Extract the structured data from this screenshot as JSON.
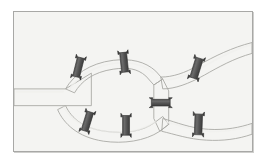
{
  "figure": {
    "width": 267,
    "height": 165,
    "background_color": "#ffffff"
  },
  "panel": {
    "background_color": "#f4f4f2",
    "border_color": "#a8a8a6",
    "shadow_color": "#cfcfcd",
    "x": 13,
    "y": 11,
    "width": 240,
    "height": 141
  },
  "colors": {
    "vessel_fill": "#d9d9d5",
    "vessel_fill_light": "#e6e6e2",
    "vessel_edge": "#a9a9a5",
    "vessel_highlight": "#f0f0ed",
    "clip_body": "#4a4a4a",
    "clip_body_light": "#6e6e6e",
    "clip_edge": "#2e2e2e"
  },
  "vessels": [
    {
      "id": "inlet-trunk",
      "label": "Main inlet trunk",
      "orientation": "horizontal",
      "from": "left-edge",
      "to": "bifurcation",
      "width_px": 13
    },
    {
      "id": "upper-arc",
      "label": "Upper arc branch",
      "orientation": "arc",
      "from": "bifurcation",
      "to": "central-junction",
      "width_px": 10
    },
    {
      "id": "lower-arc",
      "label": "Lower arc branch",
      "orientation": "arc",
      "from": "bifurcation",
      "to": "central-junction",
      "width_px": 10
    },
    {
      "id": "upper-right-branch",
      "label": "Upper right diagonal outlet",
      "orientation": "diagonal-up-right",
      "from": "central-junction",
      "to": "right-edge-upper",
      "width_px": 11
    },
    {
      "id": "lower-right-branch",
      "label": "Lower right horizontal outlet",
      "orientation": "horizontal",
      "from": "central-junction",
      "to": "right-edge-lower",
      "width_px": 11
    },
    {
      "id": "central-connector",
      "label": "Central vertical connector",
      "orientation": "vertical",
      "from": "upper-junction-node",
      "to": "lower-junction-node",
      "width_px": 9
    }
  ],
  "clips": [
    {
      "id": "clip-1",
      "label": "Clip on upper arc, proximal",
      "vessel": "upper-arc",
      "cx": 78,
      "cy": 67,
      "angle_deg": 14,
      "length": 19,
      "thickness": 5
    },
    {
      "id": "clip-2",
      "label": "Clip on upper arc, distal",
      "vessel": "upper-arc",
      "cx": 124,
      "cy": 62,
      "angle_deg": -6,
      "length": 19,
      "thickness": 5
    },
    {
      "id": "clip-3",
      "label": "Clip on lower arc, proximal",
      "vessel": "lower-arc",
      "cx": 87,
      "cy": 122,
      "angle_deg": 17,
      "length": 19,
      "thickness": 5
    },
    {
      "id": "clip-4",
      "label": "Clip on lower arc, distal",
      "vessel": "lower-arc",
      "cx": 126,
      "cy": 126,
      "angle_deg": 0,
      "length": 19,
      "thickness": 5
    },
    {
      "id": "clip-5",
      "label": "Clip on upper right diagonal outlet",
      "vessel": "upper-right-branch",
      "cx": 197,
      "cy": 68,
      "angle_deg": 17,
      "length": 20,
      "thickness": 5
    },
    {
      "id": "clip-6",
      "label": "Clip on lower right horizontal outlet",
      "vessel": "lower-right-branch",
      "cx": 199,
      "cy": 125,
      "angle_deg": 2,
      "length": 20,
      "thickness": 5
    },
    {
      "id": "clip-7",
      "label": "Horizontal clip on central vertical connector",
      "vessel": "central-connector",
      "cx": 158,
      "cy": 103,
      "angle_deg": 90,
      "length": 17,
      "thickness": 5
    }
  ],
  "counts": {
    "clip_count": 7,
    "vessel_count": 6
  }
}
